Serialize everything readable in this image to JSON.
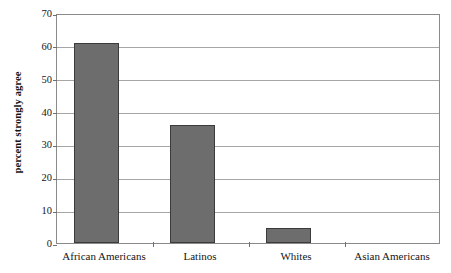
{
  "chart_data": {
    "type": "bar",
    "title": "",
    "subtitle": "",
    "xlabel": "",
    "ylabel": "percent strongly agree",
    "categories": [
      "African Americans",
      "Latinos",
      "Whites",
      "Asian Americans"
    ],
    "values": [
      61,
      36,
      4.5,
      0
    ],
    "ylim": [
      0,
      70
    ],
    "ytick_labels": [
      "0",
      "10",
      "20",
      "30",
      "40",
      "50",
      "60",
      "70"
    ],
    "ytick_values": [
      0,
      10,
      20,
      30,
      40,
      50,
      60,
      70
    ],
    "grid": true,
    "legend": "none",
    "bar_color": "#6d6d6d",
    "bar_border_color": "#3b3b3b",
    "gridline_color": "#a6a6a6",
    "axis_color": "#8a8a8a",
    "background_color": "#ffffff",
    "text_color": "#151515"
  },
  "axes": {
    "y_title": "percent strongly agree"
  }
}
